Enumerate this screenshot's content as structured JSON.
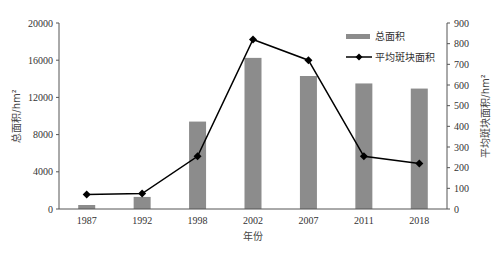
{
  "chart_data": {
    "type": "bar+line",
    "title": "",
    "xlabel": "年份",
    "ylabel_left": "总面积/hm²",
    "ylabel_right": "平均斑块面积/hm²",
    "categories": [
      "1987",
      "1992",
      "1998",
      "2002",
      "2007",
      "2011",
      "2018"
    ],
    "series": [
      {
        "name": "总面积",
        "type": "bar",
        "axis": "left",
        "color": "#8c8c8c",
        "values": [
          430,
          1300,
          9400,
          16250,
          14300,
          13500,
          12950
        ]
      },
      {
        "name": "平均斑块面积",
        "type": "line",
        "axis": "right",
        "color": "#000000",
        "marker": "diamond",
        "values": [
          70,
          75,
          255,
          820,
          720,
          255,
          220
        ]
      }
    ],
    "ylim_left": [
      0,
      20000
    ],
    "yticks_left": [
      0,
      4000,
      8000,
      12000,
      16000,
      20000
    ],
    "ylim_right": [
      0,
      900
    ],
    "yticks_right": [
      0,
      100,
      200,
      300,
      400,
      500,
      600,
      700,
      800,
      900
    ],
    "grid": false,
    "legend_position": "upper right (inside)"
  },
  "legend": {
    "bar_label": "总面积",
    "line_label": "平均斑块面积"
  },
  "axes": {
    "x_title": "年份",
    "y_left_title": "总面积/hm²",
    "y_right_title": "平均斑块面积/hm²"
  }
}
